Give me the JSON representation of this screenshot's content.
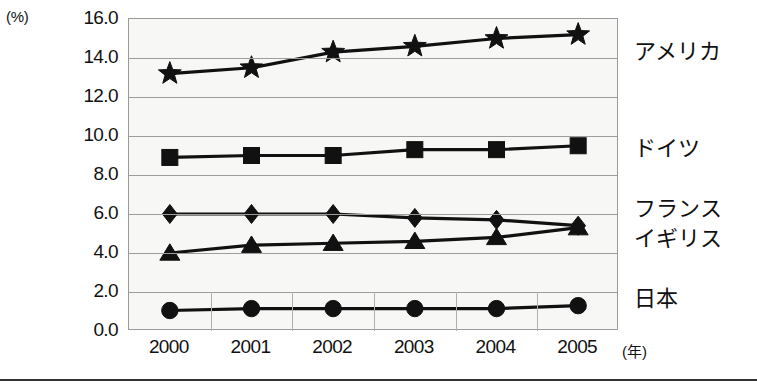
{
  "chart_data": {
    "type": "line",
    "title": "",
    "subtitle": "",
    "xlabel": "(年)",
    "ylabel": "(%)",
    "ylim": [
      0.0,
      16.0
    ],
    "ytick_step": 2.0,
    "grid": true,
    "legend_position": "right-inline",
    "categories": [
      "2000",
      "2001",
      "2002",
      "2003",
      "2004",
      "2005"
    ],
    "ytick_labels": [
      "16.0",
      "14.0",
      "12.0",
      "10.0",
      "8.0",
      "6.0",
      "4.0",
      "2.0",
      "0.0"
    ],
    "series": [
      {
        "name": "アメリカ",
        "marker": "star",
        "color": "#111111",
        "values": [
          13.2,
          13.5,
          14.3,
          14.6,
          15.0,
          15.2
        ],
        "label_y_px": 40
      },
      {
        "name": "ドイツ",
        "marker": "square",
        "color": "#111111",
        "values": [
          8.9,
          9.0,
          9.0,
          9.3,
          9.3,
          9.5
        ],
        "label_y_px": 137
      },
      {
        "name": "フランス",
        "marker": "diamond",
        "color": "#111111",
        "values": [
          6.0,
          6.0,
          6.0,
          5.8,
          5.7,
          5.4
        ],
        "label_y_px": 197
      },
      {
        "name": "イギリス",
        "marker": "triangle",
        "color": "#111111",
        "values": [
          4.0,
          4.4,
          4.5,
          4.6,
          4.8,
          5.3
        ],
        "label_y_px": 227
      },
      {
        "name": "日本",
        "marker": "circle",
        "color": "#111111",
        "values": [
          1.05,
          1.15,
          1.15,
          1.15,
          1.15,
          1.3
        ],
        "label_y_px": 287
      }
    ]
  }
}
